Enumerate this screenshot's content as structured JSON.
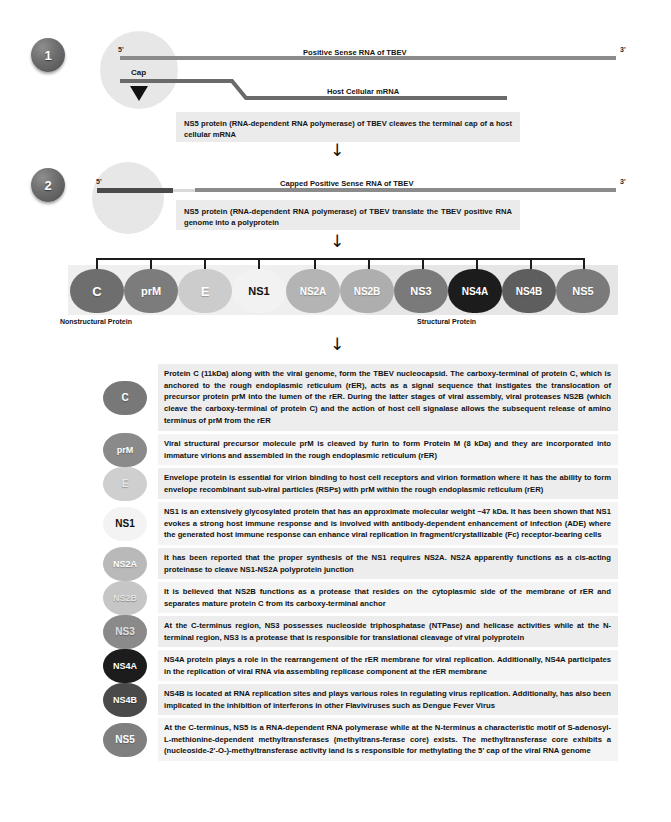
{
  "steps": [
    {
      "number": "1",
      "top_line_label": "Positive Sense RNA of TBEV",
      "bottom_line_label": "Host Cellular mRNA",
      "five_prime": "5'",
      "three_prime": "3'",
      "cap_label": "Cap",
      "note": "NS5 protein (RNA-dependent RNA polymerase) of TBEV cleaves the terminal cap of a host cellular mRNA"
    },
    {
      "number": "2",
      "top_line_label": "Capped Positive Sense RNA of TBEV",
      "five_prime": "5'",
      "three_prime": "3'",
      "note": "NS5 protein (RNA-dependent RNA polymerase) of TBEV translate the TBEV positive RNA genome into a polyprotein"
    }
  ],
  "polyprotein": {
    "left_band_label": "Nonstructural Protein",
    "right_band_label": "Structural Protein",
    "proteins": [
      {
        "label": "C",
        "color": "#6e6e6e",
        "text_color": "#ffffff",
        "font_size": "13px"
      },
      {
        "label": "prM",
        "color": "#7c7c7c",
        "text_color": "#ffffff",
        "font_size": "11px"
      },
      {
        "label": "E",
        "color": "#cccccc",
        "text_color": "#ffffff",
        "font_size": "13px"
      },
      {
        "label": "NS1",
        "color": "#f2f2f2",
        "text_color": "#111111",
        "font_size": "11px"
      },
      {
        "label": "NS2A",
        "color": "#b4b4b4",
        "text_color": "#ffffff",
        "font_size": "10px"
      },
      {
        "label": "NS2B",
        "color": "#aeaeae",
        "text_color": "#ffffff",
        "font_size": "10px"
      },
      {
        "label": "NS3",
        "color": "#7a7a7a",
        "text_color": "#ffffff",
        "font_size": "11px"
      },
      {
        "label": "NS4A",
        "color": "#1c1c1c",
        "text_color": "#ffffff",
        "font_size": "10px"
      },
      {
        "label": "NS4B",
        "color": "#5e5e5e",
        "text_color": "#ffffff",
        "font_size": "10px"
      },
      {
        "label": "NS5",
        "color": "#7a7a7a",
        "text_color": "#ffffff",
        "font_size": "11px"
      }
    ]
  },
  "descriptions": [
    {
      "label": "C",
      "color": "#787878",
      "text_color": "#ffffff",
      "font_size": "10px",
      "text": "Protein C (11kDa) along with the viral genome, form the TBEV nucleocapsid. The carboxy-terminal of protein C, which is anchored to the rough endoplasmic reticulum (rER), acts as a signal sequence that instigates the translocation of precursor protein prM into the lumen of the rER. During the latter stages of viral assembly, viral proteases NS2B (which cleave the carboxy-terminal of protein C) and the action of host cell signalase allows the subsequent release of amino terminus of prM from the rER"
    },
    {
      "label": "prM",
      "color": "#8a8a8a",
      "text_color": "#ffffff",
      "font_size": "9px",
      "text": "Viral structural precursor molecule prM is cleaved by furin to form Protein M (8 kDa) and they are incorporated into immature virions and assembled in the rough endoplasmic reticulum (rER)"
    },
    {
      "label": "E",
      "color": "#cfcfcf",
      "text_color": "#e8e8e8",
      "font_size": "10px",
      "text": "Envelope protein is essential for virion binding to host cell receptors and virion formation where it has the ability to form envelope recombinant sub-viral particles (RSPs) with prM within the rough endoplasmic reticulum (rER)"
    },
    {
      "label": "NS1",
      "color": "#f3f3f3",
      "text_color": "#111111",
      "font_size": "10px",
      "text": "NS1 is an extensively glycosylated protein that has an approximate molecular weight ~47 kDa. It has been shown that NS1 evokes a strong host immune response and is involved with antibody-dependent enhancement of infection (ADE) where the generated host immune response can enhance viral replication in fragment/crystallizable (Fc) receptor-bearing cells"
    },
    {
      "label": "NS2A",
      "color": "#b9b9b9",
      "text_color": "#ffffff",
      "font_size": "9px",
      "text": "It has been reported that the proper synthesis of the NS1 requires NS2A. NS2A apparently functions as a cis-acting proteinase to cleave NS1-NS2A polyprotein junction"
    },
    {
      "label": "NS2B",
      "color": "#c6c6c6",
      "text_color": "#e3e3e3",
      "font_size": "9px",
      "text": "It is believed that NS2B functions as a protease that resides on the cytoplasmic side of the membrane of rER and separates mature protein C from its carboxy-terminal anchor"
    },
    {
      "label": "NS3",
      "color": "#8a8a8a",
      "text_color": "#e0e0e0",
      "font_size": "10px",
      "text": "At the C-terminus region, NS3 possesses nucleoside triphosphatase (NTPase) and helicase activities while at the N-terminal region, NS3 is a protease that is responsible for translational cleavage of viral polyprotein"
    },
    {
      "label": "NS4A",
      "color": "#1c1c1c",
      "text_color": "#ffffff",
      "font_size": "9px",
      "text": "NS4A protein plays a role in the rearrangement of the rER membrane for viral replication. Additionally, NS4A participates in the replication of viral RNA via assembling replicase component at the rER membrane"
    },
    {
      "label": "NS4B",
      "color": "#4a4a4a",
      "text_color": "#ffffff",
      "font_size": "9px",
      "text": "NS4B is located at RNA replication sites and plays various roles in regulating virus replication. Additionally, has also been implicated in the inhibition of interferons in other Flaviviruses such as Dengue Fever Virus"
    },
    {
      "label": "NS5",
      "color": "#7f7f7f",
      "text_color": "#ffffff",
      "font_size": "10px",
      "text": "At the C-terminus, NS5 is a RNA-dependent RNA polymerase while at the N-terminus a characteristic motif of S-adenosyl-L-methionine-dependent methyltransferases (methyltrans-ferase core) exists. The methyltransferase core exhibits a (nucleoside-2'-O-)-methyltransferase activity iand is s responsible for methylating the 5' cap of the viral RNA genome"
    }
  ],
  "arrows": {
    "glyph": "↓"
  }
}
